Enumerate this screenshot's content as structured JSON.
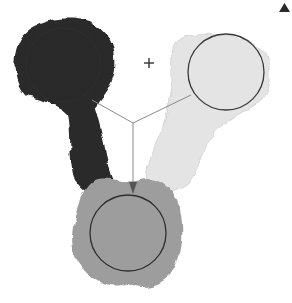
{
  "diagram": {
    "colors": {
      "dark_paint": "#2a2a2a",
      "light_paint": "#e6e6e6",
      "mixed_paint": "#9a9a9a",
      "circle_stroke": "#333333",
      "line_stroke": "#888888",
      "background": "#ffffff"
    },
    "operator_symbol": "+",
    "corner_marker": "▲"
  }
}
